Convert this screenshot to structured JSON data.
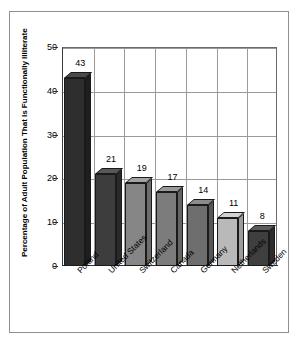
{
  "chart_data": {
    "type": "bar",
    "title": "",
    "xlabel": "",
    "ylabel": "Percentage of Adult Population That Is Functionally Illiterate",
    "categories": [
      "Poland",
      "United States",
      "Switzerland",
      "Canada",
      "Germany",
      "Netherlands",
      "Sweden"
    ],
    "values": [
      43,
      21,
      19,
      17,
      14,
      11,
      8
    ],
    "value_labels": [
      "43",
      "21",
      "19",
      "17",
      "14",
      "11",
      "8"
    ],
    "ylim": [
      0,
      50
    ],
    "yticks": [
      0,
      10,
      20,
      30,
      40,
      50
    ],
    "ytick_labels": [
      "0",
      "10",
      "20",
      "30",
      "40",
      "50"
    ],
    "grid": "both",
    "legend": "none",
    "bar_colors": [
      "#2e2e2e",
      "#3d3d3d",
      "#868686",
      "#7c7c7c",
      "#6e6e6e",
      "#b9b9b9",
      "#3f3f3f"
    ],
    "bar_top_colors": [
      "#4a4a4a",
      "#585858",
      "#a3a3a3",
      "#9a9a9a",
      "#8c8c8c",
      "#d2d2d2",
      "#5b5b5b"
    ],
    "bar_side_colors": [
      "#1e1e1e",
      "#2a2a2a",
      "#6d6d6d",
      "#646464",
      "#575757",
      "#9d9d9d",
      "#2d2d2d"
    ],
    "style": "3d-column",
    "frame_color": "#8f8f8f",
    "grid_color": "#9a9a9a",
    "axis_color": "#2e2e2e"
  }
}
